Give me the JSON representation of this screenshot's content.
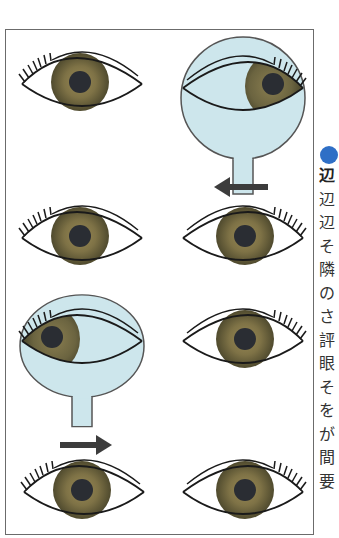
{
  "figure": {
    "colors": {
      "border": "#6b6b6b",
      "occluder_fill": "#cde6ec",
      "occluder_stroke": "#555555",
      "iris_outer": "#5a5434",
      "iris_inner": "#8a7c4c",
      "pupil": "#2a2d33",
      "arrow": "#3c3c3c",
      "bullet": "#2f6fc6"
    },
    "rows": [
      {
        "left_eye": {
          "occluded": false,
          "gaze": "center"
        },
        "right_eye": {
          "occluded": true,
          "gaze": "right"
        },
        "arrow": null
      },
      {
        "left_eye": {
          "occluded": false,
          "gaze": "center"
        },
        "right_eye": {
          "occluded": false,
          "gaze": "center"
        },
        "arrow": {
          "direction": "left",
          "over": "right_eye"
        }
      },
      {
        "left_eye": {
          "occluded": true,
          "gaze": "left"
        },
        "right_eye": {
          "occluded": false,
          "gaze": "center"
        },
        "arrow": null
      },
      {
        "left_eye": {
          "occluded": false,
          "gaze": "center"
        },
        "right_eye": {
          "occluded": false,
          "gaze": "center"
        },
        "arrow": {
          "direction": "right",
          "over": "left_eye"
        }
      }
    ]
  },
  "side_text": {
    "heading_char": "辺",
    "chars": [
      "辺",
      "辺",
      "そ",
      "隣",
      "の",
      "さ",
      "評",
      "眼",
      "そ",
      "を",
      "が",
      "間",
      "要",
      "の"
    ]
  }
}
